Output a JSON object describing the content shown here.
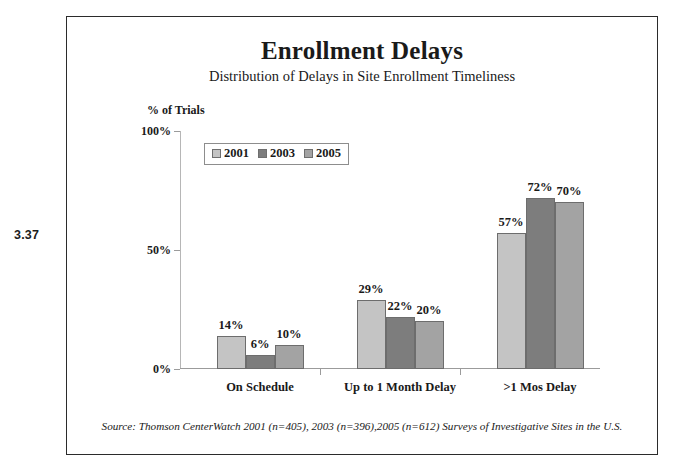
{
  "figure_number": "3.37",
  "chart_data": {
    "type": "bar",
    "title": "Enrollment Delays",
    "subtitle": "Distribution of Delays in Site Enrollment Timeliness",
    "xlabel": "",
    "ylabel": "% of Trials",
    "ylim": [
      0,
      100
    ],
    "yticks": [
      "0%",
      "50%",
      "100%"
    ],
    "ytick_values": [
      0,
      50,
      100
    ],
    "grid": false,
    "legend_position": "top-center",
    "categories": [
      "On Schedule",
      "Up to 1 Month Delay",
      ">1 Mos Delay"
    ],
    "series": [
      {
        "name": "2001",
        "color": "#c4c4c4",
        "values": [
          14,
          29,
          57
        ],
        "labels": [
          "14%",
          "29%",
          "57%"
        ]
      },
      {
        "name": "2003",
        "color": "#7d7d7d",
        "values": [
          6,
          22,
          72
        ],
        "labels": [
          "6%",
          "22%",
          "72%"
        ]
      },
      {
        "name": "2005",
        "color": "#a3a3a3",
        "values": [
          10,
          20,
          70
        ],
        "labels": [
          "10%",
          "20%",
          "70%"
        ]
      }
    ],
    "source": "Source:  Thomson CenterWatch 2001 (n=405), 2003 (n=396),2005 (n=612) Surveys of Investigative Sites in the U.S."
  }
}
